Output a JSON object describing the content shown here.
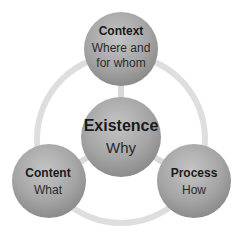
{
  "diagram": {
    "type": "hub-and-ring",
    "colors": {
      "ring": "#dedede",
      "connector": "#d6d6d6",
      "circle_light": "#bdbdbd",
      "circle_dark": "#8a8a8a",
      "text": "#1a1a1a"
    },
    "center": {
      "title": "Existence",
      "subtitle": "Why"
    },
    "nodes": [
      {
        "id": "context",
        "title": "Context",
        "subtitle_line1": "Where and",
        "subtitle_line2": "for whom"
      },
      {
        "id": "content",
        "title": "Content",
        "subtitle": "What"
      },
      {
        "id": "process",
        "title": "Process",
        "subtitle": "How"
      }
    ]
  }
}
